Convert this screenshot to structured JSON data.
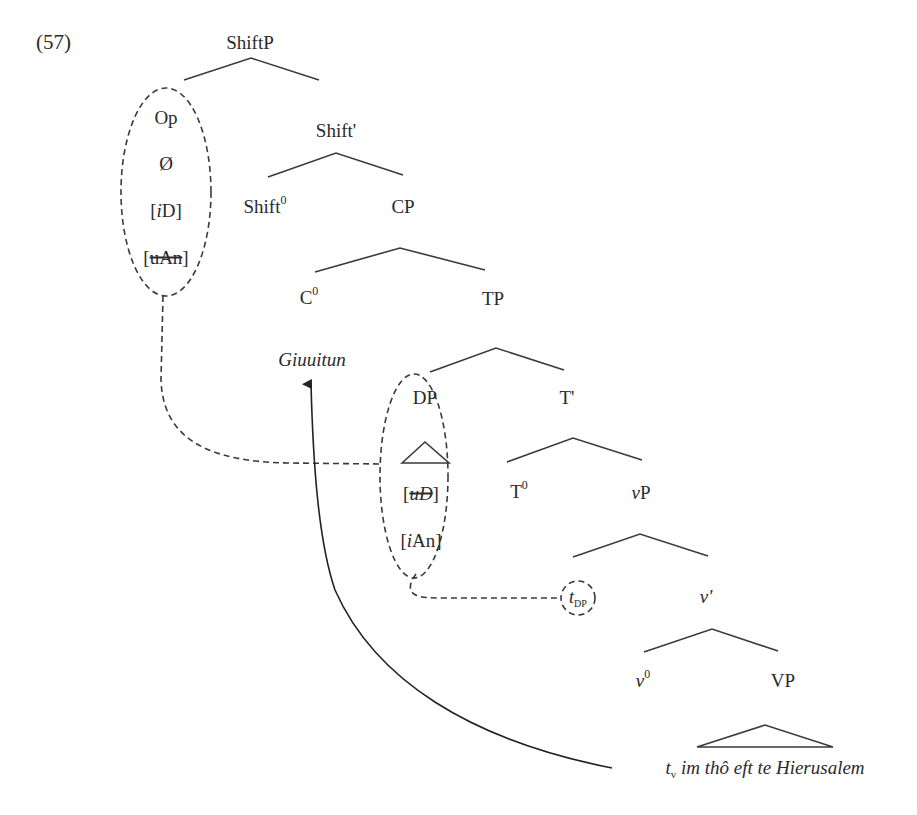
{
  "example_number": "(57)",
  "nodes": {
    "shiftp": "ShiftP",
    "op": "Op",
    "null": "Ø",
    "feature_iD_bracket_open": "[",
    "feature_iD_i": "i",
    "feature_iD_rest": "D]",
    "feature_uAn_open": "[",
    "feature_uAn_struck": "uAn",
    "feature_uAn_close": "]",
    "shift_bar": "Shift'",
    "shift_head": "Shift",
    "shift_head_sup": "0",
    "cp": "CP",
    "c_head": "C",
    "c_head_sup": "0",
    "tp": "TP",
    "moved_verb": "Giuuitun",
    "dp": "DP",
    "feature_uD_open": "[",
    "feature_uD_struck": "uD",
    "feature_uD_close": "]",
    "feature_iAn_open": "[",
    "feature_iAn_i": "i",
    "feature_iAn_rest": "An]",
    "t_bar": "T'",
    "t_head": "T",
    "t_head_sup": "0",
    "vp_small_v": "v",
    "vp_small_rest": "P",
    "trace_dp": "t",
    "trace_dp_sub": "DP",
    "v_bar": "v'",
    "v_head": "v",
    "v_head_sup": "0",
    "vp_big": "VP",
    "vp_content_trace": "t",
    "vp_content_trace_sub": "v",
    "vp_content_rest": " im thô eft te Hierusalem"
  },
  "colors": {
    "line": "#3a3a3a",
    "text": "#2a2a2a",
    "background": "#ffffff"
  }
}
